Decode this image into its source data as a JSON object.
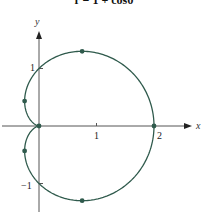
{
  "chart_data": {
    "type": "line",
    "title": "r = 1 + cosθ",
    "xlabel": "x",
    "ylabel": "y",
    "x_ticks": [
      "1",
      "2"
    ],
    "y_ticks": [
      "1",
      "−1"
    ],
    "xlim": [
      -0.7,
      2.6
    ],
    "ylim": [
      -1.5,
      1.6
    ],
    "grid": false,
    "legend": null,
    "series": [
      {
        "name": "r = 1 + cosθ (cardioid)",
        "color": "#2f5a4c",
        "equation": "r = 1 + cos(theta), theta in [0, 2π]"
      }
    ],
    "marked_points": [
      {
        "x": 2,
        "y": 0
      },
      {
        "x": 0.75,
        "y": 1.299
      },
      {
        "x": -0.25,
        "y": 0.433
      },
      {
        "x": 0,
        "y": 0
      },
      {
        "x": -0.25,
        "y": -0.433
      },
      {
        "x": 0.75,
        "y": -1.299
      }
    ]
  },
  "labels": {
    "title": "r = 1 + cosθ",
    "x_axis": "x",
    "y_axis": "y",
    "tick_x1": "1",
    "tick_x2": "2",
    "tick_y1": "1",
    "tick_yneg1": "−1"
  }
}
